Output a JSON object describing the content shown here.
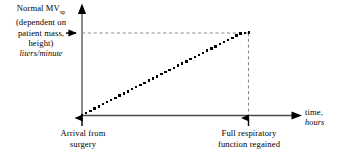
{
  "figure": {
    "background_color": "#ffffff",
    "ink_color": "#000000",
    "dash_color": "#8c8c8c"
  },
  "y_axis": {
    "label_lines": [
      "Normal MV",
      "(dependent on",
      "patient mass,",
      "height)"
    ],
    "label_subscript": "sp",
    "units": "liters/minute"
  },
  "x_axis": {
    "label": "time,",
    "units": "hours"
  },
  "annotations": {
    "left_caption_lines": [
      "Arrival from",
      "surgery"
    ],
    "right_caption_lines": [
      "Full respiratory",
      "function regained"
    ]
  },
  "chart_data": {
    "type": "line",
    "title": "",
    "xlabel": "time, hours",
    "ylabel": "Normal MVsp (dependent on patient mass, height), liters/minute",
    "grid": false,
    "legend": "none",
    "line_style": "dotted",
    "marker": "square",
    "xlim": [
      0,
      1.32
    ],
    "ylim": [
      0,
      1.22
    ],
    "x": [
      0.0,
      0.025,
      0.05,
      0.075,
      0.1,
      0.125,
      0.15,
      0.175,
      0.2,
      0.225,
      0.25,
      0.275,
      0.3,
      0.325,
      0.35,
      0.375,
      0.4,
      0.425,
      0.45,
      0.475,
      0.5,
      0.525,
      0.55,
      0.575,
      0.6,
      0.625,
      0.65,
      0.675,
      0.7,
      0.725,
      0.75,
      0.775,
      0.8,
      0.825,
      0.85,
      0.875,
      0.9,
      0.925,
      0.95,
      0.975,
      1.0
    ],
    "values": [
      0.0,
      0.026,
      0.052,
      0.078,
      0.104,
      0.13,
      0.156,
      0.182,
      0.208,
      0.234,
      0.26,
      0.286,
      0.312,
      0.338,
      0.364,
      0.39,
      0.416,
      0.442,
      0.468,
      0.494,
      0.52,
      0.546,
      0.572,
      0.598,
      0.624,
      0.65,
      0.676,
      0.702,
      0.728,
      0.754,
      0.78,
      0.806,
      0.832,
      0.858,
      0.884,
      0.91,
      0.936,
      0.962,
      0.988,
      0.994,
      1.0
    ],
    "annotations": [
      {
        "name": "setpoint-level",
        "y": 1.0,
        "style": "dashed-horizontal"
      },
      {
        "name": "recovery-time",
        "x": 1.0,
        "style": "dashed-vertical"
      },
      {
        "name": "arrival-from-surgery",
        "x": 0.0,
        "marker": "up-arrow"
      },
      {
        "name": "full-respiratory-function-regained",
        "x": 1.0,
        "marker": "up-arrow"
      },
      {
        "name": "normal-mv-setpoint",
        "y": 1.0,
        "marker": "right-arrow"
      }
    ]
  }
}
